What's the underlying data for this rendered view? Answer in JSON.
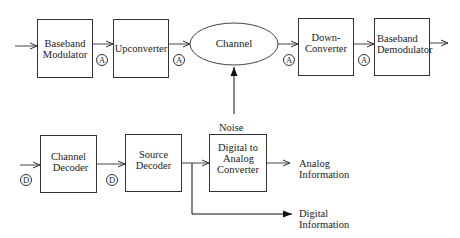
{
  "transmit_chain": {
    "blocks": [
      {
        "id": "baseband-modulator",
        "lines": [
          "Baseband",
          "Modulator"
        ]
      },
      {
        "id": "upconverter",
        "lines": [
          "Upconverter"
        ]
      },
      {
        "id": "channel",
        "lines": [
          "Channel"
        ]
      },
      {
        "id": "down-converter",
        "lines": [
          "Down-",
          "Converter"
        ]
      },
      {
        "id": "baseband-demodulator",
        "lines": [
          "Baseband",
          "Demodulator"
        ]
      }
    ],
    "markers": [
      "A",
      "A",
      "A",
      "A"
    ]
  },
  "noise": {
    "label": "Noise"
  },
  "receive_chain": {
    "blocks": [
      {
        "id": "channel-decoder",
        "lines": [
          "Channel",
          "Decoder"
        ]
      },
      {
        "id": "source-decoder",
        "lines": [
          "Source",
          "Decoder"
        ]
      },
      {
        "id": "digital-to-analog-converter",
        "lines": [
          "Digital to",
          "Analog",
          "Converter"
        ]
      }
    ],
    "markers": [
      "D",
      "D"
    ]
  },
  "outputs": {
    "analog": [
      "Analog",
      "Information"
    ],
    "digital": [
      "Digital",
      "Information"
    ]
  }
}
